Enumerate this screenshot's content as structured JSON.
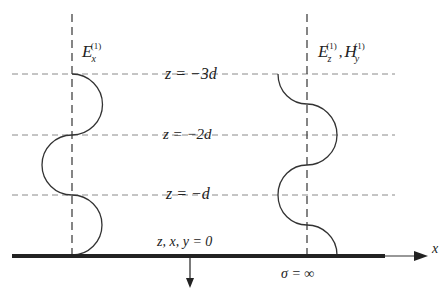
{
  "diagram": {
    "labels": {
      "left_field": "E",
      "left_field_sub": "x",
      "left_field_sup": "(1)",
      "right_field_e": "E",
      "right_field_e_sub": "z",
      "right_field_e_sup": "(1)",
      "right_field_sep": ",",
      "right_field_h": "H",
      "right_field_h_sub": "y",
      "right_field_h_sup": "(1)",
      "z_minus_3d": "z = −3d",
      "z_minus_2d": "z = −2d",
      "z_minus_d": "z = −d",
      "origin": "z, x, y = 0",
      "x_axis": "x",
      "sigma": "σ = ∞"
    },
    "colors": {
      "line": "#333333",
      "dash": "#888888",
      "ground": "#222222"
    }
  }
}
